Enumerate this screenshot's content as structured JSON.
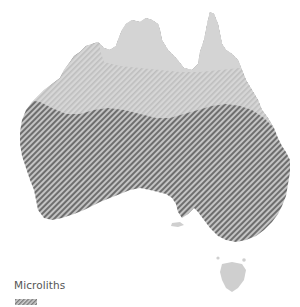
{
  "map": {
    "subject": "Australia",
    "zones": [
      {
        "name": "northern-zone",
        "style": "solid",
        "fill": "#d4d4d4"
      },
      {
        "name": "central-band",
        "style": "light-hatch",
        "fill": "#cfcfcf",
        "hatch_color": "#bdbdbd"
      },
      {
        "name": "southern-zone",
        "style": "dark-hatch",
        "fill": "#c2c2c2",
        "hatch_color": "#6a6a6a"
      },
      {
        "name": "tasmania",
        "style": "solid",
        "fill": "#cfcfcf"
      }
    ]
  },
  "legend": {
    "title": "Microliths",
    "swatch_style": "dark-hatch"
  },
  "colors": {
    "background": "#ffffff",
    "land_light": "#d4d4d4",
    "hatch_dark": "#6a6a6a",
    "hatch_light": "#bdbdbd",
    "text": "#555555"
  }
}
